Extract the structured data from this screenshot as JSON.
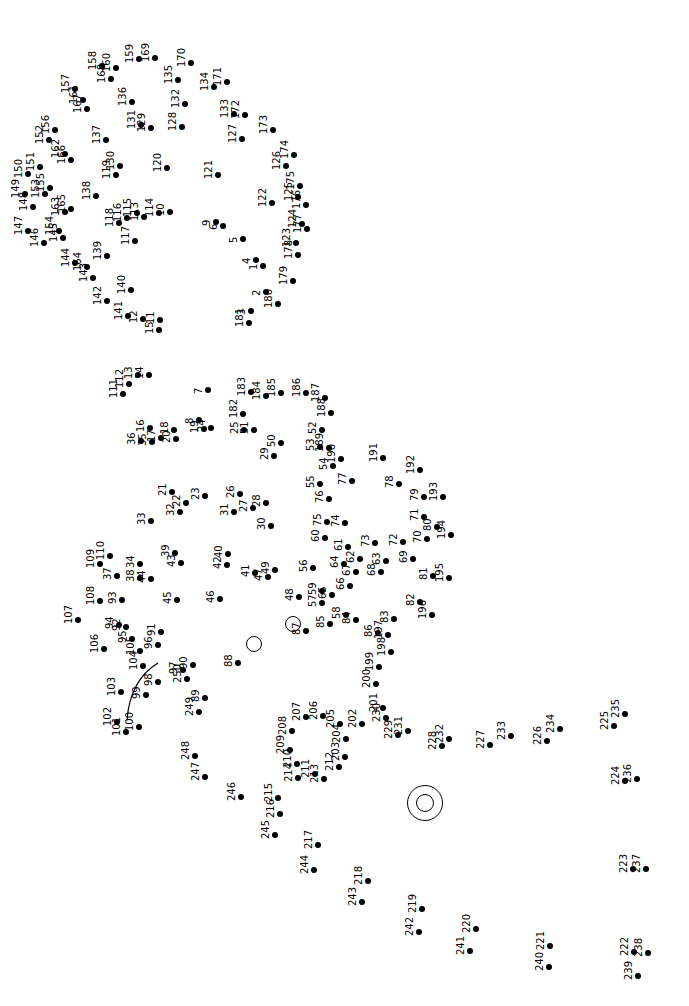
{
  "puzzle": {
    "title": "Connect the dots",
    "orientation": "rotated -90deg",
    "dot_color": "#000000",
    "total_dots": 250,
    "eye_circles": [
      {
        "x": 253,
        "y": 643,
        "r": 7
      },
      {
        "x": 292,
        "y": 623,
        "r": 7
      },
      {
        "x": 424,
        "y": 802,
        "r": 17
      },
      {
        "x": 424,
        "y": 802,
        "r": 8
      }
    ],
    "arc": {
      "from": [
        127,
        720
      ],
      "to": [
        158,
        663
      ]
    },
    "dots": [
      {
        "n": "1",
        "x": 263,
        "y": 266
      },
      {
        "n": "2",
        "x": 266,
        "y": 292
      },
      {
        "n": "3",
        "x": 251,
        "y": 311
      },
      {
        "n": "4",
        "x": 256,
        "y": 260
      },
      {
        "n": "5",
        "x": 243,
        "y": 239
      },
      {
        "n": "6",
        "x": 223,
        "y": 226
      },
      {
        "n": "7",
        "x": 208,
        "y": 390
      },
      {
        "n": "8",
        "x": 199,
        "y": 420
      },
      {
        "n": "9",
        "x": 216,
        "y": 222
      },
      {
        "n": "10",
        "x": 170,
        "y": 212
      },
      {
        "n": "11",
        "x": 160,
        "y": 320
      },
      {
        "n": "12",
        "x": 143,
        "y": 319
      },
      {
        "n": "13",
        "x": 138,
        "y": 375
      },
      {
        "n": "14",
        "x": 149,
        "y": 375
      },
      {
        "n": "15",
        "x": 159,
        "y": 330
      },
      {
        "n": "16",
        "x": 150,
        "y": 428
      },
      {
        "n": "17",
        "x": 161,
        "y": 438
      },
      {
        "n": "18",
        "x": 174,
        "y": 430
      },
      {
        "n": "19",
        "x": 204,
        "y": 429
      },
      {
        "n": "20",
        "x": 176,
        "y": 439
      },
      {
        "n": "21",
        "x": 172,
        "y": 492
      },
      {
        "n": "22",
        "x": 186,
        "y": 503
      },
      {
        "n": "23",
        "x": 205,
        "y": 496
      },
      {
        "n": "24",
        "x": 211,
        "y": 428
      },
      {
        "n": "25",
        "x": 244,
        "y": 430
      },
      {
        "n": "26",
        "x": 240,
        "y": 494
      },
      {
        "n": "27",
        "x": 253,
        "y": 508
      },
      {
        "n": "28",
        "x": 266,
        "y": 503
      },
      {
        "n": "29",
        "x": 274,
        "y": 456
      },
      {
        "n": "30",
        "x": 271,
        "y": 526
      },
      {
        "n": "31",
        "x": 234,
        "y": 512
      },
      {
        "n": "32",
        "x": 180,
        "y": 512
      },
      {
        "n": "33",
        "x": 151,
        "y": 521
      },
      {
        "n": "34",
        "x": 140,
        "y": 564
      },
      {
        "n": "35",
        "x": 152,
        "y": 442
      },
      {
        "n": "36",
        "x": 141,
        "y": 441
      },
      {
        "n": "37",
        "x": 117,
        "y": 576
      },
      {
        "n": "38",
        "x": 140,
        "y": 578
      },
      {
        "n": "39",
        "x": 175,
        "y": 553
      },
      {
        "n": "40",
        "x": 228,
        "y": 554
      },
      {
        "n": "41",
        "x": 255,
        "y": 573
      },
      {
        "n": "42",
        "x": 227,
        "y": 565
      },
      {
        "n": "43",
        "x": 181,
        "y": 563
      },
      {
        "n": "44",
        "x": 151,
        "y": 579
      },
      {
        "n": "45",
        "x": 177,
        "y": 600
      },
      {
        "n": "46",
        "x": 220,
        "y": 599
      },
      {
        "n": "47",
        "x": 268,
        "y": 577
      },
      {
        "n": "48",
        "x": 299,
        "y": 597
      },
      {
        "n": "49",
        "x": 275,
        "y": 570
      },
      {
        "n": "50",
        "x": 281,
        "y": 443
      },
      {
        "n": "51",
        "x": 254,
        "y": 430
      },
      {
        "n": "52",
        "x": 322,
        "y": 430
      },
      {
        "n": "53",
        "x": 320,
        "y": 447
      },
      {
        "n": "54",
        "x": 333,
        "y": 466
      },
      {
        "n": "55",
        "x": 320,
        "y": 484
      },
      {
        "n": "56",
        "x": 313,
        "y": 568
      },
      {
        "n": "57",
        "x": 322,
        "y": 603
      },
      {
        "n": "58",
        "x": 346,
        "y": 615
      },
      {
        "n": "59",
        "x": 322,
        "y": 591
      },
      {
        "n": "60",
        "x": 325,
        "y": 538
      },
      {
        "n": "61",
        "x": 348,
        "y": 547
      },
      {
        "n": "62",
        "x": 360,
        "y": 559
      },
      {
        "n": "63",
        "x": 386,
        "y": 561
      },
      {
        "n": "64",
        "x": 344,
        "y": 564
      },
      {
        "n": "65",
        "x": 332,
        "y": 595
      },
      {
        "n": "66",
        "x": 350,
        "y": 586
      },
      {
        "n": "67",
        "x": 356,
        "y": 572
      },
      {
        "n": "68",
        "x": 381,
        "y": 572
      },
      {
        "n": "69",
        "x": 413,
        "y": 559
      },
      {
        "n": "70",
        "x": 427,
        "y": 539
      },
      {
        "n": "71",
        "x": 424,
        "y": 517
      },
      {
        "n": "72",
        "x": 403,
        "y": 542
      },
      {
        "n": "73",
        "x": 375,
        "y": 543
      },
      {
        "n": "74",
        "x": 345,
        "y": 523
      },
      {
        "n": "75",
        "x": 327,
        "y": 522
      },
      {
        "n": "76",
        "x": 329,
        "y": 499
      },
      {
        "n": "77",
        "x": 352,
        "y": 481
      },
      {
        "n": "78",
        "x": 399,
        "y": 484
      },
      {
        "n": "79",
        "x": 424,
        "y": 497
      },
      {
        "n": "80",
        "x": 437,
        "y": 527
      },
      {
        "n": "81",
        "x": 433,
        "y": 576
      },
      {
        "n": "82",
        "x": 420,
        "y": 602
      },
      {
        "n": "83",
        "x": 394,
        "y": 619
      },
      {
        "n": "84",
        "x": 356,
        "y": 620
      },
      {
        "n": "85",
        "x": 330,
        "y": 624
      },
      {
        "n": "86",
        "x": 378,
        "y": 633
      },
      {
        "n": "87",
        "x": 306,
        "y": 631
      },
      {
        "n": "88",
        "x": 238,
        "y": 663
      },
      {
        "n": "89",
        "x": 205,
        "y": 698
      },
      {
        "n": "90",
        "x": 193,
        "y": 665
      },
      {
        "n": "91",
        "x": 161,
        "y": 632
      },
      {
        "n": "92",
        "x": 126,
        "y": 627
      },
      {
        "n": "93",
        "x": 122,
        "y": 600
      },
      {
        "n": "94",
        "x": 119,
        "y": 625
      },
      {
        "n": "95",
        "x": 132,
        "y": 639
      },
      {
        "n": "96",
        "x": 158,
        "y": 645
      },
      {
        "n": "97",
        "x": 183,
        "y": 670
      },
      {
        "n": "98",
        "x": 158,
        "y": 682
      },
      {
        "n": "99",
        "x": 146,
        "y": 695
      },
      {
        "n": "100",
        "x": 139,
        "y": 727
      },
      {
        "n": "101",
        "x": 126,
        "y": 732
      },
      {
        "n": "102",
        "x": 117,
        "y": 722
      },
      {
        "n": "103",
        "x": 121,
        "y": 692
      },
      {
        "n": "104",
        "x": 143,
        "y": 666
      },
      {
        "n": "105",
        "x": 140,
        "y": 651
      },
      {
        "n": "106",
        "x": 104,
        "y": 649
      },
      {
        "n": "107",
        "x": 78,
        "y": 620
      },
      {
        "n": "108",
        "x": 100,
        "y": 601
      },
      {
        "n": "109",
        "x": 100,
        "y": 564
      },
      {
        "n": "110",
        "x": 110,
        "y": 556
      },
      {
        "n": "111",
        "x": 123,
        "y": 394
      },
      {
        "n": "112",
        "x": 129,
        "y": 384
      },
      {
        "n": "113",
        "x": 144,
        "y": 217
      },
      {
        "n": "114",
        "x": 159,
        "y": 213
      },
      {
        "n": "115",
        "x": 137,
        "y": 213
      },
      {
        "n": "116",
        "x": 127,
        "y": 218
      },
      {
        "n": "117",
        "x": 135,
        "y": 241
      },
      {
        "n": "118",
        "x": 119,
        "y": 223
      },
      {
        "n": "119",
        "x": 116,
        "y": 175
      },
      {
        "n": "120",
        "x": 167,
        "y": 168
      },
      {
        "n": "121",
        "x": 218,
        "y": 175
      },
      {
        "n": "122",
        "x": 272,
        "y": 203
      },
      {
        "n": "123",
        "x": 296,
        "y": 243
      },
      {
        "n": "124",
        "x": 302,
        "y": 224
      },
      {
        "n": "125",
        "x": 298,
        "y": 197
      },
      {
        "n": "126",
        "x": 286,
        "y": 166
      },
      {
        "n": "127",
        "x": 242,
        "y": 139
      },
      {
        "n": "128",
        "x": 182,
        "y": 127
      },
      {
        "n": "129",
        "x": 151,
        "y": 128
      },
      {
        "n": "130",
        "x": 120,
        "y": 166
      },
      {
        "n": "131",
        "x": 141,
        "y": 125
      },
      {
        "n": "132",
        "x": 185,
        "y": 104
      },
      {
        "n": "133",
        "x": 234,
        "y": 114
      },
      {
        "n": "134",
        "x": 214,
        "y": 87
      },
      {
        "n": "135",
        "x": 178,
        "y": 80
      },
      {
        "n": "136",
        "x": 132,
        "y": 102
      },
      {
        "n": "137",
        "x": 106,
        "y": 140
      },
      {
        "n": "138",
        "x": 96,
        "y": 196
      },
      {
        "n": "139",
        "x": 107,
        "y": 256
      },
      {
        "n": "140",
        "x": 131,
        "y": 290
      },
      {
        "n": "141",
        "x": 128,
        "y": 316
      },
      {
        "n": "142",
        "x": 107,
        "y": 301
      },
      {
        "n": "143",
        "x": 93,
        "y": 278
      },
      {
        "n": "144",
        "x": 75,
        "y": 263
      },
      {
        "n": "145",
        "x": 63,
        "y": 238
      },
      {
        "n": "146",
        "x": 44,
        "y": 243
      },
      {
        "n": "147",
        "x": 28,
        "y": 231
      },
      {
        "n": "148",
        "x": 33,
        "y": 207
      },
      {
        "n": "149",
        "x": 25,
        "y": 194
      },
      {
        "n": "150",
        "x": 28,
        "y": 174
      },
      {
        "n": "151",
        "x": 40,
        "y": 167
      },
      {
        "n": "152",
        "x": 49,
        "y": 140
      },
      {
        "n": "153",
        "x": 45,
        "y": 194
      },
      {
        "n": "154",
        "x": 59,
        "y": 231
      },
      {
        "n": "155",
        "x": 50,
        "y": 188
      },
      {
        "n": "156",
        "x": 55,
        "y": 130
      },
      {
        "n": "157",
        "x": 75,
        "y": 89
      },
      {
        "n": "158",
        "x": 102,
        "y": 66
      },
      {
        "n": "159",
        "x": 139,
        "y": 59
      },
      {
        "n": "160",
        "x": 116,
        "y": 68
      },
      {
        "n": "161",
        "x": 83,
        "y": 100
      },
      {
        "n": "162",
        "x": 65,
        "y": 154
      },
      {
        "n": "163",
        "x": 65,
        "y": 212
      },
      {
        "n": "164",
        "x": 87,
        "y": 267
      },
      {
        "n": "165",
        "x": 71,
        "y": 209
      },
      {
        "n": "166",
        "x": 71,
        "y": 160
      },
      {
        "n": "167",
        "x": 87,
        "y": 109
      },
      {
        "n": "168",
        "x": 111,
        "y": 79
      },
      {
        "n": "169",
        "x": 155,
        "y": 58
      },
      {
        "n": "170",
        "x": 191,
        "y": 63
      },
      {
        "n": "171",
        "x": 227,
        "y": 82
      },
      {
        "n": "172",
        "x": 245,
        "y": 115
      },
      {
        "n": "173",
        "x": 273,
        "y": 130
      },
      {
        "n": "174",
        "x": 294,
        "y": 155
      },
      {
        "n": "175",
        "x": 300,
        "y": 186
      },
      {
        "n": "176",
        "x": 306,
        "y": 205
      },
      {
        "n": "177",
        "x": 307,
        "y": 229
      },
      {
        "n": "178",
        "x": 298,
        "y": 255
      },
      {
        "n": "179",
        "x": 293,
        "y": 281
      },
      {
        "n": "180",
        "x": 278,
        "y": 304
      },
      {
        "n": "181",
        "x": 249,
        "y": 323
      },
      {
        "n": "182",
        "x": 243,
        "y": 414
      },
      {
        "n": "183",
        "x": 251,
        "y": 392
      },
      {
        "n": "184",
        "x": 266,
        "y": 396
      },
      {
        "n": "185",
        "x": 281,
        "y": 393
      },
      {
        "n": "186",
        "x": 306,
        "y": 393
      },
      {
        "n": "187",
        "x": 325,
        "y": 398
      },
      {
        "n": "188",
        "x": 331,
        "y": 413
      },
      {
        "n": "189",
        "x": 329,
        "y": 448
      },
      {
        "n": "190",
        "x": 341,
        "y": 459
      },
      {
        "n": "191",
        "x": 383,
        "y": 458
      },
      {
        "n": "192",
        "x": 420,
        "y": 470
      },
      {
        "n": "193",
        "x": 443,
        "y": 497
      },
      {
        "n": "194",
        "x": 451,
        "y": 535
      },
      {
        "n": "195",
        "x": 449,
        "y": 578
      },
      {
        "n": "196",
        "x": 432,
        "y": 615
      },
      {
        "n": "197",
        "x": 388,
        "y": 635
      },
      {
        "n": "198",
        "x": 391,
        "y": 652
      },
      {
        "n": "199",
        "x": 379,
        "y": 667
      },
      {
        "n": "200",
        "x": 376,
        "y": 684
      },
      {
        "n": "201",
        "x": 383,
        "y": 708
      },
      {
        "n": "202",
        "x": 362,
        "y": 724
      },
      {
        "n": "203",
        "x": 345,
        "y": 757
      },
      {
        "n": "204",
        "x": 346,
        "y": 739
      },
      {
        "n": "205",
        "x": 340,
        "y": 724
      },
      {
        "n": "206",
        "x": 323,
        "y": 716
      },
      {
        "n": "207",
        "x": 306,
        "y": 717
      },
      {
        "n": "208",
        "x": 292,
        "y": 731
      },
      {
        "n": "209",
        "x": 290,
        "y": 750
      },
      {
        "n": "210",
        "x": 297,
        "y": 764
      },
      {
        "n": "211",
        "x": 315,
        "y": 774
      },
      {
        "n": "212",
        "x": 339,
        "y": 767
      },
      {
        "n": "213",
        "x": 324,
        "y": 779
      },
      {
        "n": "214",
        "x": 298,
        "y": 778
      },
      {
        "n": "215",
        "x": 278,
        "y": 798
      },
      {
        "n": "216",
        "x": 280,
        "y": 814
      },
      {
        "n": "217",
        "x": 318,
        "y": 845
      },
      {
        "n": "218",
        "x": 368,
        "y": 881
      },
      {
        "n": "219",
        "x": 422,
        "y": 909
      },
      {
        "n": "220",
        "x": 476,
        "y": 929
      },
      {
        "n": "221",
        "x": 550,
        "y": 946
      },
      {
        "n": "222",
        "x": 634,
        "y": 952
      },
      {
        "n": "223",
        "x": 633,
        "y": 869
      },
      {
        "n": "224",
        "x": 625,
        "y": 781
      },
      {
        "n": "225",
        "x": 614,
        "y": 726
      },
      {
        "n": "226",
        "x": 547,
        "y": 741
      },
      {
        "n": "227",
        "x": 490,
        "y": 745
      },
      {
        "n": "228",
        "x": 442,
        "y": 746
      },
      {
        "n": "229",
        "x": 398,
        "y": 735
      },
      {
        "n": "230",
        "x": 386,
        "y": 718
      },
      {
        "n": "231",
        "x": 408,
        "y": 731
      },
      {
        "n": "232",
        "x": 449,
        "y": 739
      },
      {
        "n": "233",
        "x": 511,
        "y": 736
      },
      {
        "n": "234",
        "x": 560,
        "y": 729
      },
      {
        "n": "235",
        "x": 625,
        "y": 714
      },
      {
        "n": "236",
        "x": 637,
        "y": 779
      },
      {
        "n": "237",
        "x": 646,
        "y": 869
      },
      {
        "n": "238",
        "x": 648,
        "y": 953
      },
      {
        "n": "239",
        "x": 638,
        "y": 976
      },
      {
        "n": "240",
        "x": 549,
        "y": 967
      },
      {
        "n": "241",
        "x": 470,
        "y": 951
      },
      {
        "n": "242",
        "x": 419,
        "y": 932
      },
      {
        "n": "243",
        "x": 362,
        "y": 902
      },
      {
        "n": "244",
        "x": 314,
        "y": 870
      },
      {
        "n": "245",
        "x": 275,
        "y": 835
      },
      {
        "n": "246",
        "x": 241,
        "y": 797
      },
      {
        "n": "247",
        "x": 205,
        "y": 777
      },
      {
        "n": "248",
        "x": 195,
        "y": 756
      },
      {
        "n": "249",
        "x": 199,
        "y": 712
      },
      {
        "n": "250",
        "x": 187,
        "y": 679
      }
    ]
  }
}
